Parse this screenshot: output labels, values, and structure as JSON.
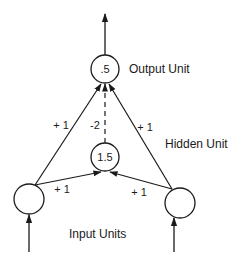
{
  "diagram": {
    "units": {
      "output": {
        "value": ".5",
        "label": "Output Unit"
      },
      "hidden": {
        "value": "1.5",
        "label": "Hidden Unit"
      },
      "inputs": {
        "label": "Input Units"
      }
    },
    "weights": {
      "input_left_to_output": "+ 1",
      "input_right_to_output": "+ 1",
      "hidden_to_output": "-2",
      "input_left_to_hidden": "+ 1",
      "input_right_to_hidden": "+ 1"
    },
    "colors": {
      "stroke": "#1a1a1a",
      "background": "#ffffff"
    }
  }
}
